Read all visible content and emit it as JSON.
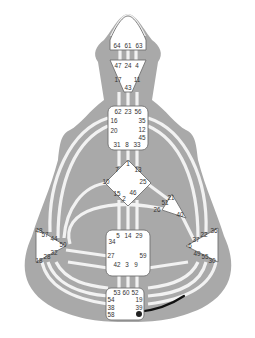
{
  "diagram": {
    "type": "human-design-bodygraph",
    "colors": {
      "body": "#a9a9a9",
      "center_fill": "#ffffff",
      "center_stroke": "#707070",
      "channel": "#f2f2f2",
      "active_channel": "#111111",
      "text": "#333333"
    },
    "centers": {
      "head": {
        "gates": [
          "64",
          "61",
          "63"
        ]
      },
      "ajna": {
        "gates": [
          "47",
          "24",
          "4",
          "17",
          "11",
          "43"
        ]
      },
      "throat": {
        "gates": [
          "62",
          "23",
          "56",
          "16",
          "35",
          "12",
          "20",
          "45",
          "31",
          "8",
          "33"
        ]
      },
      "g": {
        "gates": [
          "1",
          "7",
          "13",
          "10",
          "25",
          "15",
          "46",
          "2"
        ]
      },
      "heart": {
        "gates": [
          "21",
          "51",
          "26",
          "40"
        ]
      },
      "spleen": {
        "gates": [
          "48",
          "57",
          "44",
          "50",
          "32",
          "28",
          "18"
        ]
      },
      "sacral": {
        "gates": [
          "5",
          "14",
          "29",
          "34",
          "27",
          "59",
          "42",
          "3",
          "9"
        ]
      },
      "solar_plexus": {
        "gates": [
          "36",
          "22",
          "37",
          "6",
          "49",
          "55",
          "30"
        ]
      },
      "root": {
        "gates": [
          "53",
          "60",
          "52",
          "54",
          "19",
          "38",
          "39",
          "58"
        ]
      }
    },
    "active_gate": "41",
    "active_channel": "41-30"
  }
}
